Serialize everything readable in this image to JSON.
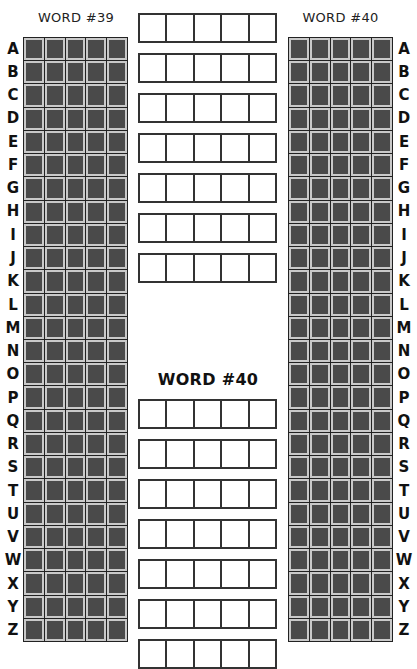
{
  "left_board": {
    "title": "WORD #39"
  },
  "right_board": {
    "title": "WORD #40"
  },
  "middle": {
    "section_title": "WORD #40"
  },
  "letters": [
    "A",
    "B",
    "C",
    "D",
    "E",
    "F",
    "G",
    "H",
    "I",
    "J",
    "K",
    "L",
    "M",
    "N",
    "O",
    "P",
    "Q",
    "R",
    "S",
    "T",
    "U",
    "V",
    "W",
    "X",
    "Y",
    "Z"
  ],
  "colors": {
    "cell_fill": "#4a4a4a",
    "cell_border": "#c9c9c9",
    "grid_line": "#222222",
    "guess_border": "#333333"
  },
  "guess_rows_top": {
    "count": 7,
    "letters_per_row": 5,
    "tops": [
      13,
      53,
      93,
      133,
      173,
      213,
      253
    ]
  },
  "guess_rows_bottom": {
    "count": 7,
    "letters_per_row": 5,
    "tops": [
      399,
      439,
      479,
      519,
      559,
      599,
      639
    ]
  }
}
